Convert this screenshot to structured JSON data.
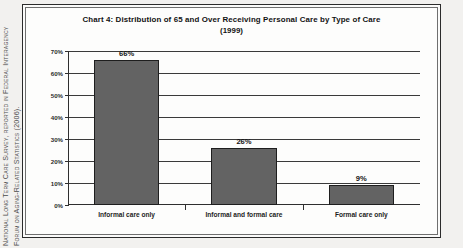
{
  "citation": {
    "line1": "National Long Term Care Survey, reported in Federal Interagency",
    "line2": "Forum on Aging-Related Statistics (2006)."
  },
  "chart_data": {
    "type": "bar",
    "title": "Chart 4:  Distribution of 65 and Over Receiving Personal Care by Type of Care",
    "subtitle": "(1999)",
    "xlabel": "",
    "ylabel": "",
    "categories": [
      "Informal care only",
      "Informal and formal care",
      "Formal care only"
    ],
    "values": [
      66,
      26,
      9
    ],
    "data_labels": [
      "66%",
      "26%",
      "9%"
    ],
    "ylim": [
      0,
      70
    ],
    "ytick_values": [
      0,
      10,
      20,
      30,
      40,
      50,
      60,
      70
    ],
    "ytick_labels": [
      "0%",
      "10%",
      "20%",
      "30%",
      "40%",
      "50%",
      "60%",
      "70%"
    ],
    "grid": true,
    "legend": false,
    "bar_color": "#636363",
    "bar_border_color": "#1e1e1e",
    "axis_color": "#2f2f2f"
  }
}
